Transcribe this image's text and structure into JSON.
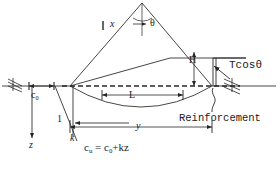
{
  "figure": {
    "stroke_color": "#262626",
    "background": "#ffffff"
  },
  "labels": {
    "x": "x",
    "theta": "θ",
    "H": "H",
    "tension_horizontal": "Tcosθ",
    "L": "L",
    "y": "y",
    "c0": "c",
    "c0_sub": "0",
    "slope_one": "1",
    "slope_k": "k",
    "depth_z": "z",
    "strength_cu": "c",
    "strength_cu_sub": "u",
    "strength_equals": "=",
    "strength_c0": "c",
    "strength_c0_sub": "0",
    "strength_plus_kz": "+kz",
    "reinforcement": "Reinforcement"
  },
  "geometry": {
    "ground_line_y": 86,
    "wedge_apex": [
      142,
      3
    ],
    "wedge_left_toe": [
      70,
      86
    ],
    "wedge_right_toe": [
      212,
      86
    ],
    "arc_depth": 110,
    "inner_crest_y": 58,
    "L_span": [
      102,
      183
    ],
    "y_span": [
      70,
      212
    ],
    "c0_span": [
      28,
      55
    ]
  }
}
